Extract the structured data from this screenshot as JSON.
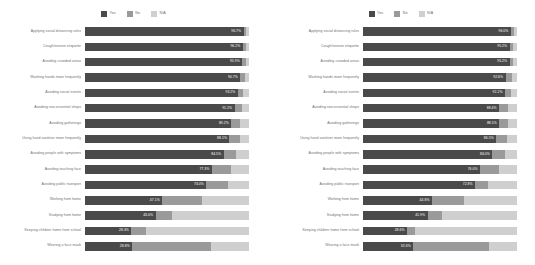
{
  "legend": {
    "items": [
      {
        "label": "Yes",
        "color": "#4a4a4a",
        "key": "yes"
      },
      {
        "label": "No",
        "color": "#9a9a9a",
        "key": "no"
      },
      {
        "label": "N/A",
        "color": "#cfcfcf",
        "key": "na"
      }
    ]
  },
  "chart_data": [
    {
      "type": "bar",
      "orientation": "horizontal",
      "stacked": true,
      "normalized": true,
      "title": "",
      "xlabel": "",
      "ylabel": "",
      "xlim": [
        0,
        100
      ],
      "grid": false,
      "legend_position": "top-center",
      "series": [
        {
          "name": "Yes",
          "color": "#4a4a4a"
        },
        {
          "name": "No",
          "color": "#9a9a9a"
        },
        {
          "name": "N/A",
          "color": "#cfcfcf"
        }
      ],
      "categories": [
        "Applying social distancing rules",
        "Cough/sneeze etiquette",
        "Avoiding crowded areas",
        "Washing hands more frequently",
        "Avoiding social events",
        "Avoiding non-essential shops",
        "Avoiding gatherings",
        "Using hand sanitiser more frequently",
        "Avoiding people with symptoms",
        "Avoiding touching face",
        "Avoiding public transport",
        "Working from home",
        "Studying from home",
        "Keeping children home from school",
        "Wearing a face mask"
      ],
      "rows": [
        {
          "label": "Applying social distancing rules",
          "yes": 96.7,
          "no": 1.6,
          "na": 1.7,
          "value_label": "96.7%"
        },
        {
          "label": "Cough/sneeze etiquette",
          "yes": 96.2,
          "no": 1.9,
          "na": 1.9,
          "value_label": "96.2%"
        },
        {
          "label": "Avoiding crowded areas",
          "yes": 95.9,
          "no": 2.1,
          "na": 2.0,
          "value_label": "95.9%"
        },
        {
          "label": "Washing hands more frequently",
          "yes": 94.7,
          "no": 2.8,
          "na": 2.5,
          "value_label": "94.7%"
        },
        {
          "label": "Avoiding social events",
          "yes": 93.2,
          "no": 3.4,
          "na": 3.4,
          "value_label": "93.2%"
        },
        {
          "label": "Avoiding non-essential shops",
          "yes": 91.2,
          "no": 4.4,
          "na": 4.4,
          "value_label": "91.2%"
        },
        {
          "label": "Avoiding gatherings",
          "yes": 89.2,
          "no": 5.4,
          "na": 5.4,
          "value_label": "89.2%"
        },
        {
          "label": "Using hand sanitiser more frequently",
          "yes": 88.1,
          "no": 6.2,
          "na": 5.7,
          "value_label": "88.1%"
        },
        {
          "label": "Avoiding people with symptoms",
          "yes": 84.5,
          "no": 7.5,
          "na": 8.0,
          "value_label": "84.5%"
        },
        {
          "label": "Avoiding touching face",
          "yes": 77.3,
          "no": 12.0,
          "na": 10.7,
          "value_label": "77.3%"
        },
        {
          "label": "Avoiding public transport",
          "yes": 74.0,
          "no": 13.5,
          "na": 12.5,
          "value_label": "74.0%"
        },
        {
          "label": "Working from home",
          "yes": 47.1,
          "no": 24.0,
          "na": 28.9,
          "value_label": "47.1%"
        },
        {
          "label": "Studying from home",
          "yes": 43.0,
          "no": 10.0,
          "na": 47.0,
          "value_label": "43.0%"
        },
        {
          "label": "Keeping children home from school",
          "yes": 28.3,
          "no": 9.0,
          "na": 62.7,
          "value_label": "28.3%"
        },
        {
          "label": "Wearing a face mask",
          "yes": 28.8,
          "no": 48.0,
          "na": 23.2,
          "value_label": "28.8%"
        }
      ]
    },
    {
      "type": "bar",
      "orientation": "horizontal",
      "stacked": true,
      "normalized": true,
      "title": "",
      "xlabel": "",
      "ylabel": "",
      "xlim": [
        0,
        100
      ],
      "grid": false,
      "legend_position": "top-center",
      "series": [
        {
          "name": "Yes",
          "color": "#4a4a4a"
        },
        {
          "name": "No",
          "color": "#9a9a9a"
        },
        {
          "name": "N/A",
          "color": "#cfcfcf"
        }
      ],
      "categories": [
        "Applying social distancing rules",
        "Cough/sneeze etiquette",
        "Avoiding crowded areas",
        "Washing hands more frequently",
        "Avoiding social events",
        "Avoiding non-essential shops",
        "Avoiding gatherings",
        "Using hand sanitiser more frequently",
        "Avoiding people with symptoms",
        "Avoiding touching face",
        "Avoiding public transport",
        "Working from home",
        "Studying from home",
        "Keeping children home from school",
        "Wearing a face mask"
      ],
      "rows": [
        {
          "label": "Applying social distancing rules",
          "yes": 96.0,
          "no": 2.0,
          "na": 2.0,
          "value_label": "96.0%"
        },
        {
          "label": "Cough/sneeze etiquette",
          "yes": 95.2,
          "no": 2.4,
          "na": 2.4,
          "value_label": "95.2%"
        },
        {
          "label": "Avoiding crowded areas",
          "yes": 95.2,
          "no": 2.4,
          "na": 2.4,
          "value_label": "95.2%"
        },
        {
          "label": "Washing hands more frequently",
          "yes": 92.6,
          "no": 4.4,
          "na": 3.0,
          "value_label": "92.6%"
        },
        {
          "label": "Avoiding social events",
          "yes": 92.2,
          "no": 4.2,
          "na": 3.6,
          "value_label": "92.2%"
        },
        {
          "label": "Avoiding non-essential shops",
          "yes": 88.4,
          "no": 5.8,
          "na": 5.8,
          "value_label": "88.4%"
        },
        {
          "label": "Avoiding gatherings",
          "yes": 88.5,
          "no": 5.8,
          "na": 5.7,
          "value_label": "88.5%"
        },
        {
          "label": "Using hand sanitiser more frequently",
          "yes": 86.5,
          "no": 7.0,
          "na": 6.5,
          "value_label": "86.5%"
        },
        {
          "label": "Avoiding people with symptoms",
          "yes": 84.0,
          "no": 8.0,
          "na": 8.0,
          "value_label": "84.0%"
        },
        {
          "label": "Avoiding touching face",
          "yes": 76.0,
          "no": 12.0,
          "na": 12.0,
          "value_label": "76.0%"
        },
        {
          "label": "Avoiding public transport",
          "yes": 72.8,
          "no": 8.2,
          "na": 19.0,
          "value_label": "72.8%"
        },
        {
          "label": "Working from home",
          "yes": 44.8,
          "no": 21.0,
          "na": 34.2,
          "value_label": "44.8%"
        },
        {
          "label": "Studying from home",
          "yes": 41.9,
          "no": 9.1,
          "na": 49.0,
          "value_label": "41.9%"
        },
        {
          "label": "Keeping children home from school",
          "yes": 28.6,
          "no": 5.4,
          "na": 66.0,
          "value_label": "28.6%"
        },
        {
          "label": "Wearing a face mask",
          "yes": 32.6,
          "no": 49.4,
          "na": 18.0,
          "value_label": "32.6%"
        }
      ]
    }
  ]
}
